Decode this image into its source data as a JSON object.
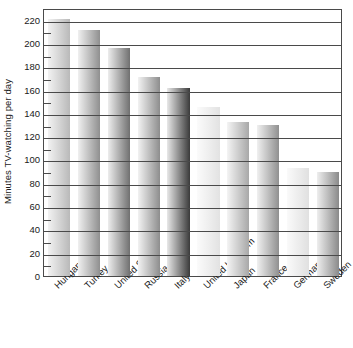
{
  "chart_data": {
    "type": "bar",
    "title": "",
    "subtitle": "",
    "xlabel": "",
    "ylabel": "Minutes TV-watching per day",
    "categories": [
      "Hungary",
      "Turkey",
      "United States",
      "Russia",
      "Italy",
      "United Kingdom",
      "Japan",
      "France",
      "Germany",
      "Sweden"
    ],
    "values": [
      221,
      211,
      196,
      171,
      161,
      145,
      132,
      130,
      93,
      89
    ],
    "ylim": [
      0,
      230
    ],
    "y_major_ticks": [
      0,
      20,
      40,
      60,
      80,
      100,
      120,
      140,
      160,
      180,
      200,
      220
    ],
    "y_minor_ticks": [
      10,
      30,
      50,
      70,
      90,
      110,
      130,
      150,
      170,
      190,
      210
    ],
    "y_tick_labels": [
      "0",
      "20",
      "40",
      "60",
      "80",
      "100",
      "120",
      "140",
      "160",
      "180",
      "200",
      "220"
    ],
    "grid": true,
    "grid_axis": "y",
    "legend": false,
    "legend_position": "none",
    "orientation": "vertical",
    "bar_fill_style": "horizontal-gradient",
    "bar_gradients": [
      {
        "category": "Hungary",
        "from": "#f2f2f2",
        "to": "#b9b9b9"
      },
      {
        "category": "Turkey",
        "from": "#f0f0f0",
        "to": "#8f8f8f"
      },
      {
        "category": "United States",
        "from": "#ededed",
        "to": "#707070"
      },
      {
        "category": "Russia",
        "from": "#f2f2f2",
        "to": "#8d8d8d"
      },
      {
        "category": "Italy",
        "from": "#e8e8e8",
        "to": "#3a3a3a"
      },
      {
        "category": "United Kingdom",
        "from": "#fbfbfb",
        "to": "#e2e2e2"
      },
      {
        "category": "Japan",
        "from": "#f4f4f4",
        "to": "#a8a8a8"
      },
      {
        "category": "France",
        "from": "#f0f0f0",
        "to": "#909090"
      },
      {
        "category": "Germany",
        "from": "#fafafa",
        "to": "#e0e0e0"
      },
      {
        "category": "Sweden",
        "from": "#eeeeee",
        "to": "#8a8a8a"
      }
    ]
  },
  "colors": {
    "axis": "#4a4a4a",
    "text": "#1a1a1a",
    "background": "#ffffff"
  }
}
